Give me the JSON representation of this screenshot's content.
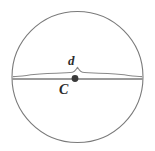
{
  "figure": {
    "kind": "geometry-diagram",
    "background_color": "#ffffff",
    "stroke_color": "#7a7a7a",
    "label_color": "#2b2b2b",
    "point_color": "#3a3a3a",
    "labels": {
      "diameter": "d",
      "center": "C"
    },
    "circle": {
      "center_x": 77.5,
      "center_y": 77.0,
      "radius": 65.5,
      "stroke_width": 1.1
    },
    "diameter_line": {
      "x1": 12.5,
      "y1": 79.0,
      "x2": 142.5,
      "y2": 79.0,
      "stroke_width": 1.2
    },
    "brace": {
      "x_start": 13.0,
      "x_end": 142.0,
      "baseline_y": 75.5,
      "peak_y": 67.0,
      "peak_x": 77.5
    },
    "center_point": {
      "cx": 75.0,
      "cy": 78.5,
      "r": 3.4
    }
  }
}
